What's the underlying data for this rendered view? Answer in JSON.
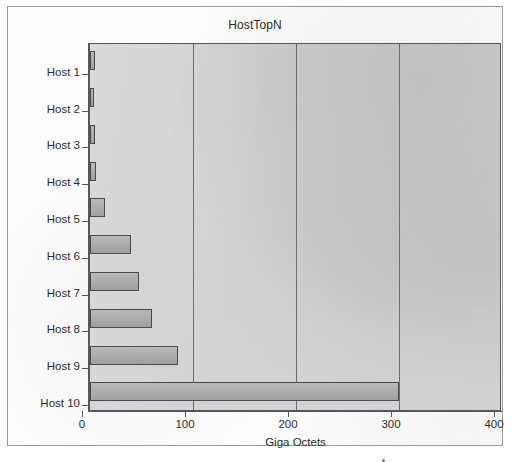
{
  "window": {
    "frame_border_color": "#9a9a9a",
    "background_color": "#ffffff"
  },
  "chart_data": {
    "type": "bar",
    "orientation": "horizontal",
    "title": "HostTopN",
    "xlabel": "Giga Octets",
    "ylabel": "",
    "categories": [
      "Host 1",
      "Host 2",
      "Host 3",
      "Host 4",
      "Host 5",
      "Host 6",
      "Host 7",
      "Host 8",
      "Host 9",
      "Host 10"
    ],
    "values": [
      5,
      4,
      5,
      6,
      15,
      40,
      48,
      60,
      85,
      300
    ],
    "xlim": [
      0,
      400
    ],
    "xticks": [
      0,
      100,
      200,
      300,
      400
    ],
    "xtick_labels": [
      "0",
      "100",
      "200",
      "300",
      "400"
    ],
    "grid": true,
    "grid_axis": "x",
    "legend": false,
    "plot_background_color": "#d2d2d2",
    "bar_fill_color": "#a9a9a9",
    "bar_edge_color": "#4a4a4c",
    "gridline_color": "#6b6d70",
    "axis_color": "#55575a",
    "text_color": "#2c2c2c"
  }
}
